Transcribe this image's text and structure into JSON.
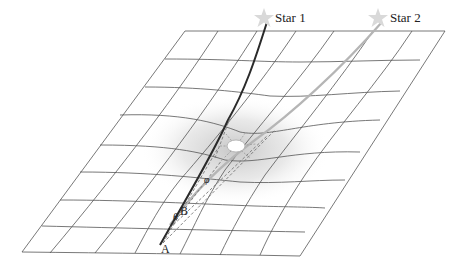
{
  "diagram": {
    "type": "gravitational-lensing-spacetime-grid",
    "labels": {
      "star1": "Star 1",
      "star2": "Star 2",
      "point_a": "A",
      "point_b": "B",
      "angle_theta": "θ",
      "angle_phi": "φ"
    },
    "elements": [
      {
        "name": "spacetime-grid",
        "description": "perspective grid warped downward around central mass"
      },
      {
        "name": "sun",
        "description": "central bright mass with radiating dashed rays"
      },
      {
        "name": "light-path-star1",
        "description": "dark curved line from Star 1 to A"
      },
      {
        "name": "light-path-star2",
        "description": "light gray line from Star 2 toward B"
      },
      {
        "name": "dashed-sight-lines",
        "description": "dashed lines from A/B through region near sun"
      }
    ],
    "colors": {
      "grid": "#555555",
      "path_star1": "#2a2a2a",
      "path_star2": "#b5b5b5",
      "shadow": "#cfcfcf",
      "star_glyph": "#d9d9d9",
      "text": "#222222"
    }
  }
}
